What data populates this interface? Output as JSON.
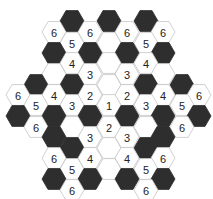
{
  "puzzle": {
    "type": "hexagonal-number-puzzle",
    "colors": {
      "dark": "#2e2e2e",
      "light": "#ffffff",
      "border": "#c4c4c4",
      "text": "#222222"
    },
    "hex_size": 12,
    "cells": [
      {
        "x": 72,
        "y": 21,
        "dark": true,
        "n": ""
      },
      {
        "x": 109,
        "y": 21,
        "dark": true,
        "n": ""
      },
      {
        "x": 146,
        "y": 21,
        "dark": true,
        "n": ""
      },
      {
        "x": 54,
        "y": 32,
        "dark": false,
        "n": "6"
      },
      {
        "x": 90,
        "y": 32,
        "dark": false,
        "n": "6"
      },
      {
        "x": 127,
        "y": 32,
        "dark": false,
        "n": "6"
      },
      {
        "x": 163,
        "y": 32,
        "dark": false,
        "n": "6"
      },
      {
        "x": 72,
        "y": 43,
        "dark": false,
        "n": "5"
      },
      {
        "x": 109,
        "y": 43,
        "dark": false,
        "n": ""
      },
      {
        "x": 146,
        "y": 43,
        "dark": false,
        "n": "5"
      },
      {
        "x": 54,
        "y": 53,
        "dark": true,
        "n": ""
      },
      {
        "x": 90,
        "y": 53,
        "dark": true,
        "n": ""
      },
      {
        "x": 127,
        "y": 53,
        "dark": true,
        "n": ""
      },
      {
        "x": 163,
        "y": 53,
        "dark": true,
        "n": ""
      },
      {
        "x": 72,
        "y": 63,
        "dark": false,
        "n": "4"
      },
      {
        "x": 109,
        "y": 63,
        "dark": false,
        "n": ""
      },
      {
        "x": 146,
        "y": 63,
        "dark": false,
        "n": "4"
      },
      {
        "x": 54,
        "y": 74,
        "dark": false,
        "n": ""
      },
      {
        "x": 90,
        "y": 74,
        "dark": false,
        "n": "3"
      },
      {
        "x": 127,
        "y": 74,
        "dark": false,
        "n": "3"
      },
      {
        "x": 163,
        "y": 74,
        "dark": false,
        "n": ""
      },
      {
        "x": 36,
        "y": 85,
        "dark": true,
        "n": ""
      },
      {
        "x": 72,
        "y": 85,
        "dark": true,
        "n": ""
      },
      {
        "x": 109,
        "y": 85,
        "dark": false,
        "n": ""
      },
      {
        "x": 146,
        "y": 85,
        "dark": true,
        "n": ""
      },
      {
        "x": 182,
        "y": 85,
        "dark": true,
        "n": ""
      },
      {
        "x": 18,
        "y": 95,
        "dark": false,
        "n": "6"
      },
      {
        "x": 54,
        "y": 95,
        "dark": false,
        "n": "4"
      },
      {
        "x": 90,
        "y": 95,
        "dark": false,
        "n": "2"
      },
      {
        "x": 127,
        "y": 95,
        "dark": false,
        "n": "2"
      },
      {
        "x": 163,
        "y": 95,
        "dark": false,
        "n": "4"
      },
      {
        "x": 199,
        "y": 95,
        "dark": false,
        "n": "6"
      },
      {
        "x": 36,
        "y": 105,
        "dark": false,
        "n": "5"
      },
      {
        "x": 72,
        "y": 105,
        "dark": false,
        "n": "3"
      },
      {
        "x": 109,
        "y": 105,
        "dark": false,
        "n": "1"
      },
      {
        "x": 146,
        "y": 105,
        "dark": false,
        "n": "3"
      },
      {
        "x": 182,
        "y": 105,
        "dark": false,
        "n": "5"
      },
      {
        "x": 18,
        "y": 116,
        "dark": true,
        "n": ""
      },
      {
        "x": 54,
        "y": 116,
        "dark": true,
        "n": ""
      },
      {
        "x": 90,
        "y": 116,
        "dark": true,
        "n": ""
      },
      {
        "x": 127,
        "y": 116,
        "dark": true,
        "n": ""
      },
      {
        "x": 163,
        "y": 116,
        "dark": true,
        "n": ""
      },
      {
        "x": 199,
        "y": 116,
        "dark": true,
        "n": ""
      },
      {
        "x": 36,
        "y": 127,
        "dark": false,
        "n": "6"
      },
      {
        "x": 72,
        "y": 127,
        "dark": false,
        "n": ""
      },
      {
        "x": 109,
        "y": 127,
        "dark": false,
        "n": "2"
      },
      {
        "x": 146,
        "y": 127,
        "dark": false,
        "n": ""
      },
      {
        "x": 182,
        "y": 127,
        "dark": false,
        "n": "6"
      },
      {
        "x": 54,
        "y": 137,
        "dark": true,
        "n": ""
      },
      {
        "x": 90,
        "y": 137,
        "dark": false,
        "n": "3"
      },
      {
        "x": 127,
        "y": 137,
        "dark": false,
        "n": "3"
      },
      {
        "x": 163,
        "y": 137,
        "dark": true,
        "n": ""
      },
      {
        "x": 72,
        "y": 148,
        "dark": true,
        "n": ""
      },
      {
        "x": 109,
        "y": 148,
        "dark": false,
        "n": ""
      },
      {
        "x": 146,
        "y": 148,
        "dark": true,
        "n": ""
      },
      {
        "x": 54,
        "y": 158,
        "dark": false,
        "n": "6"
      },
      {
        "x": 90,
        "y": 158,
        "dark": false,
        "n": "4"
      },
      {
        "x": 127,
        "y": 158,
        "dark": false,
        "n": "4"
      },
      {
        "x": 163,
        "y": 158,
        "dark": false,
        "n": "6"
      },
      {
        "x": 72,
        "y": 169,
        "dark": false,
        "n": "5"
      },
      {
        "x": 109,
        "y": 169,
        "dark": false,
        "n": ""
      },
      {
        "x": 146,
        "y": 169,
        "dark": false,
        "n": "5"
      },
      {
        "x": 54,
        "y": 179,
        "dark": true,
        "n": ""
      },
      {
        "x": 90,
        "y": 179,
        "dark": true,
        "n": ""
      },
      {
        "x": 127,
        "y": 179,
        "dark": true,
        "n": ""
      },
      {
        "x": 163,
        "y": 179,
        "dark": true,
        "n": ""
      },
      {
        "x": 72,
        "y": 190,
        "dark": false,
        "n": "6"
      },
      {
        "x": 146,
        "y": 190,
        "dark": false,
        "n": "6"
      }
    ]
  }
}
